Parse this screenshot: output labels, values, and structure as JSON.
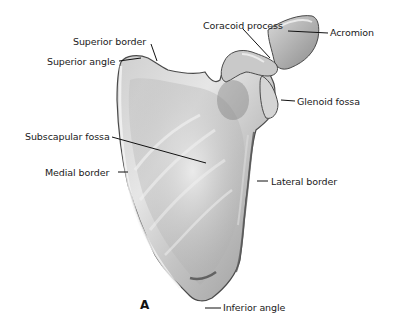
{
  "figure": {
    "panel_letter": "A",
    "colors": {
      "bone_light": "#e8e8e8",
      "bone_mid": "#b5b5b5",
      "bone_dark": "#6e6e6e",
      "outline": "#4a4a4a",
      "leader": "#111111",
      "background": "#ffffff"
    }
  },
  "labels": {
    "superior_border": "Superior border",
    "superior_angle": "Superior angle",
    "coracoid_process": "Coracoid process",
    "acromion": "Acromion",
    "glenoid_fossa": "Glenoid fossa",
    "subscapular_fossa": "Subscapular fossa",
    "medial_border": "Medial border",
    "lateral_border": "Lateral border",
    "inferior_angle": "Inferior angle"
  }
}
